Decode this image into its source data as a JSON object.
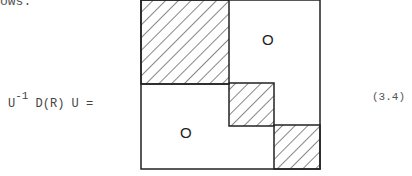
{
  "intro_text": "ows:",
  "equation": {
    "lhs_U": "U",
    "lhs_exp": "-1",
    "lhs_rest": " D(R) U =",
    "number": "(3.4)"
  },
  "matrix": {
    "blocks": [
      {
        "name": "block-1",
        "hatched": true
      },
      {
        "name": "block-2",
        "hatched": true
      },
      {
        "name": "block-3",
        "hatched": true
      }
    ],
    "zero_upper": "O",
    "zero_lower": "O"
  }
}
